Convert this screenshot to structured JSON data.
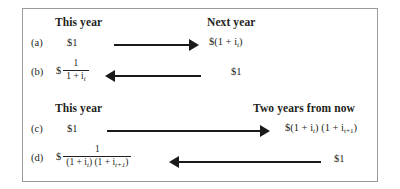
{
  "figure": {
    "panels": [
      {
        "id": "one-year",
        "header_left": "This year",
        "header_right": "Next year",
        "rows": [
          {
            "label": "(a)",
            "left_value": "$1",
            "right_value": "$(1 + i",
            "right_value_sub": "t",
            "right_value_tail": ")",
            "arrow_direction": "right",
            "arrow_name": "arrow-row-a"
          },
          {
            "label": "(b)",
            "left_dollar": "$",
            "left_numerator": "1",
            "left_denominator": "1 + i",
            "left_denominator_sub": "t",
            "right_value": "$1",
            "arrow_direction": "left",
            "arrow_name": "arrow-row-b"
          }
        ]
      },
      {
        "id": "two-year",
        "header_left": "This year",
        "header_right": "Two years from now",
        "rows": [
          {
            "label": "(c)",
            "left_value": "$1",
            "right_value_a": "$(1 + i",
            "right_value_a_sub": "t",
            "right_value_mid": ") (1 + i",
            "right_value_b_sub": "t+1",
            "right_value_tail": ")",
            "arrow_direction": "right",
            "arrow_name": "arrow-row-c"
          },
          {
            "label": "(d)",
            "left_dollar": "$",
            "left_numerator": "1",
            "left_den_a": "(1 + i",
            "left_den_a_sub": "t",
            "left_den_mid": ") (1 + i",
            "left_den_b_sub": "t+1",
            "left_den_tail": ")",
            "right_value": "$1",
            "arrow_direction": "left",
            "arrow_name": "arrow-row-d"
          }
        ]
      }
    ],
    "colors": {
      "ink": "#231f20",
      "arrow": "#1a1a1a",
      "border": "#9a9a9a",
      "background": "#ffffff"
    }
  }
}
